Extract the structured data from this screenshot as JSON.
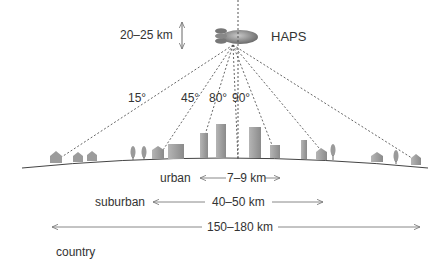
{
  "diagram": {
    "platform_label": "HAPS",
    "altitude_label": "20–25 km",
    "elevation_angles": [
      "15°",
      "45°",
      "80°",
      "90°"
    ],
    "coverage": [
      {
        "zone": "urban",
        "range": "7–9 km"
      },
      {
        "zone": "suburban",
        "range": "40–50 km"
      },
      {
        "zone": "country",
        "range": "150–180 km"
      }
    ],
    "colors": {
      "line": "#555555",
      "building": "#9a9a9a",
      "airship": "#888888"
    }
  }
}
